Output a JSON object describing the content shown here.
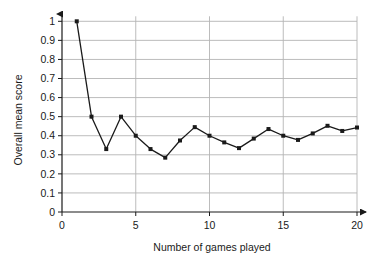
{
  "chart_data": {
    "type": "line",
    "title": "",
    "xlabel": "Number of games played",
    "ylabel": "Overall mean score",
    "xlim": [
      0,
      20.6
    ],
    "ylim": [
      0,
      1.05
    ],
    "xticks": [
      "0",
      "5",
      "10",
      "15",
      "20"
    ],
    "xtick_values": [
      0,
      5,
      10,
      15,
      20
    ],
    "yticks": [
      "0",
      "0.1",
      "0.2",
      "0.3",
      "0.4",
      "0.5",
      "0.6",
      "0.7",
      "0.8",
      "0.9",
      "1"
    ],
    "ytick_values": [
      0,
      0.1,
      0.2,
      0.3,
      0.4,
      0.5,
      0.6,
      0.7,
      0.8,
      0.9,
      1.0
    ],
    "grid": "horizontal-and-vertical-at-xticks",
    "legend": "none",
    "marker": "filled-square",
    "line_color": "#1a1a1a",
    "marker_color": "#1a1a1a",
    "grid_color": "#b4b4b4",
    "axis_color": "#4d4d4d",
    "x": [
      1,
      2,
      3,
      4,
      5,
      6,
      7,
      8,
      9,
      10,
      11,
      12,
      13,
      14,
      15,
      16,
      17,
      18,
      19,
      20
    ],
    "values": [
      1.0,
      0.5,
      0.33,
      0.5,
      0.4,
      0.33,
      0.285,
      0.375,
      0.445,
      0.4,
      0.365,
      0.335,
      0.385,
      0.435,
      0.4,
      0.378,
      0.412,
      0.452,
      0.425,
      0.443
    ]
  }
}
